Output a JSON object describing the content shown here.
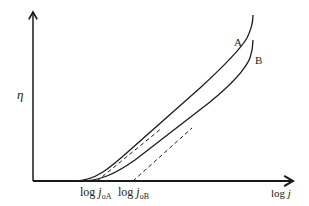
{
  "diagram": {
    "type": "tafel-plot",
    "y_axis": {
      "label": "η"
    },
    "x_axis": {
      "label_prefix": "log ",
      "label_var": "j"
    },
    "curves": [
      {
        "id": "A",
        "label": "A"
      },
      {
        "id": "B",
        "label": "B"
      }
    ],
    "intercepts": [
      {
        "prefix": "log ",
        "var": "j",
        "sub": "oA"
      },
      {
        "prefix": "log ",
        "var": "j",
        "sub": "oB"
      }
    ],
    "colors": {
      "line": "#1a1a1a",
      "text": "#222222",
      "background": "#ffffff"
    }
  }
}
